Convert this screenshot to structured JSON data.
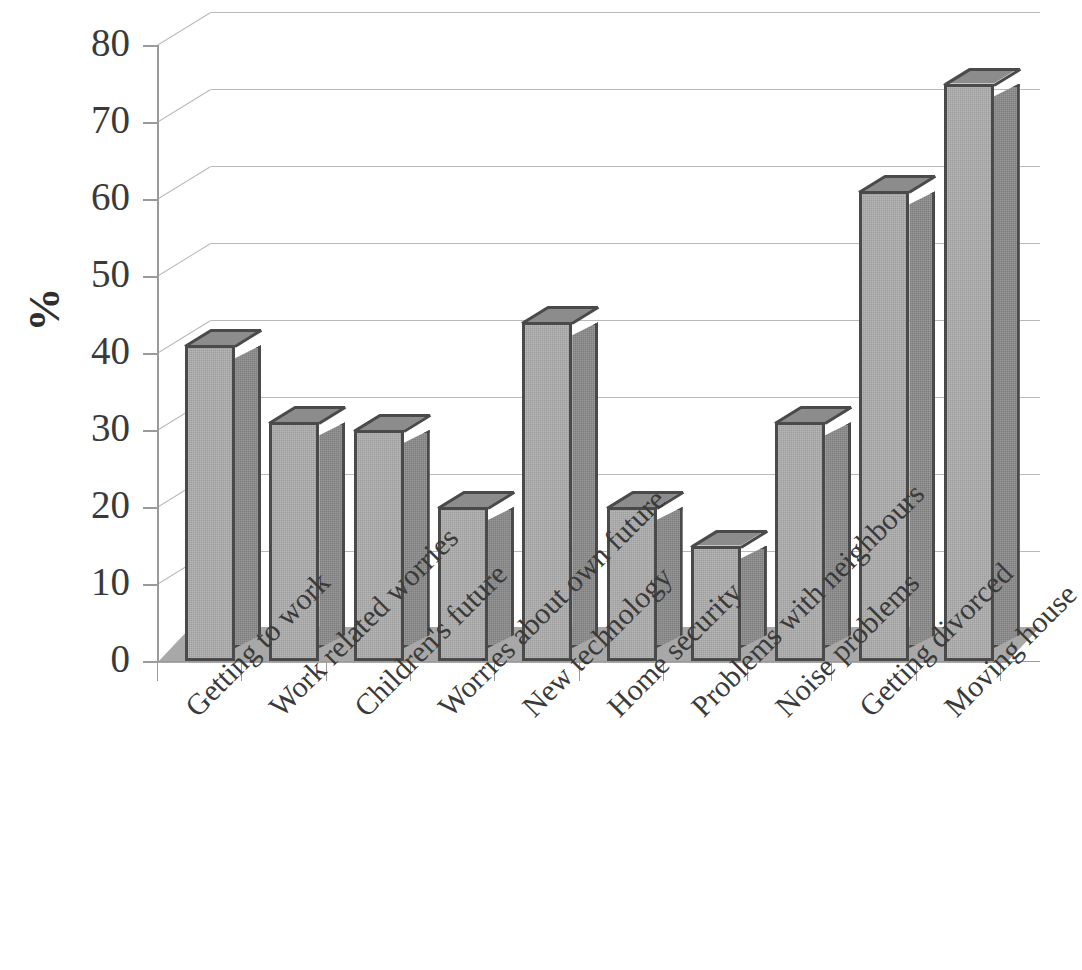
{
  "chart_data": {
    "type": "bar",
    "title": "",
    "subtitle": "",
    "xlabel": "",
    "ylabel": "%",
    "ylim": [
      0,
      80
    ],
    "ytick_step": 10,
    "yticks": [
      0,
      10,
      20,
      30,
      40,
      50,
      60,
      70,
      80
    ],
    "ytick_labels": [
      "0",
      "10",
      "20",
      "30",
      "40",
      "50",
      "60",
      "70",
      "80"
    ],
    "grid": true,
    "grid_axis": "y",
    "legend": false,
    "legend_position": "none",
    "style": "3d-column",
    "categories": [
      "Getting to work",
      "Work related worries",
      "Children's future",
      "Worries about own future",
      "New technology",
      "Home security",
      "Problems with neighbours",
      "Noise problems",
      "Getting divorced",
      "Moving house"
    ],
    "values": [
      41,
      31,
      30,
      20,
      44,
      20,
      15,
      31,
      61,
      75
    ],
    "series": [
      {
        "name": "",
        "values": [
          41,
          31,
          30,
          20,
          44,
          20,
          15,
          31,
          61,
          75
        ]
      }
    ],
    "annotations": [],
    "xtick_label_rotation_deg": 45
  },
  "colors": {
    "bar_front": "#9e9e9e",
    "bar_side": "#7e7e7e",
    "bar_top": "#8c8c8c",
    "bar_outline": "#4a4a4a",
    "floor": "#a8a8a8",
    "gridline": "#b9b9b9",
    "axis": "#9a9a9a",
    "text": "#3a3a3a",
    "background": "#ffffff"
  }
}
